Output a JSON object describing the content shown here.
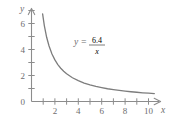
{
  "chart_data": {
    "type": "line",
    "title": "",
    "subtitle": "",
    "xlabel": "x",
    "ylabel": "y",
    "xlim": [
      0,
      11.2
    ],
    "ylim": [
      0,
      7.3
    ],
    "grid": false,
    "legend_position": "none",
    "equation_label": {
      "lhs": "y",
      "equals": "=",
      "numerator": "6.4",
      "denominator": "x",
      "full_text": "y = 6.4/x",
      "x_position": 3.2,
      "y_position": 4.6
    },
    "x_ticks_major": [
      2,
      4,
      6,
      8,
      10
    ],
    "x_tick_labels": [
      "2",
      "4",
      "6",
      "8",
      "10"
    ],
    "x_ticks_all": [
      1,
      2,
      3,
      4,
      5,
      6,
      7,
      8,
      9,
      10
    ],
    "y_ticks_major": [
      0,
      2,
      4,
      6
    ],
    "y_tick_labels": [
      "0",
      "2",
      "4",
      "6"
    ],
    "y_ticks_all": [
      1,
      2,
      3,
      4,
      5,
      6,
      7
    ],
    "series": [
      {
        "name": "y = 6.4/x",
        "constant": 6.4,
        "x": [
          0.95,
          1.1,
          1.3,
          1.5,
          1.75,
          2.0,
          2.25,
          2.5,
          2.75,
          3.0,
          3.5,
          4.0,
          4.5,
          5.0,
          5.5,
          6.0,
          6.5,
          7.0,
          7.5,
          8.0,
          8.5,
          9.0,
          9.5,
          10.0,
          10.5
        ],
        "values": [
          6.74,
          5.82,
          4.92,
          4.27,
          3.66,
          3.2,
          2.84,
          2.56,
          2.33,
          2.13,
          1.83,
          1.6,
          1.42,
          1.28,
          1.16,
          1.07,
          0.98,
          0.91,
          0.85,
          0.8,
          0.75,
          0.71,
          0.67,
          0.64,
          0.61
        ]
      }
    ],
    "colors": {
      "curve": "#7d7d7d",
      "axis": "#8c8c8c",
      "text": "#6e6e6e",
      "background": "#ffffff"
    }
  }
}
